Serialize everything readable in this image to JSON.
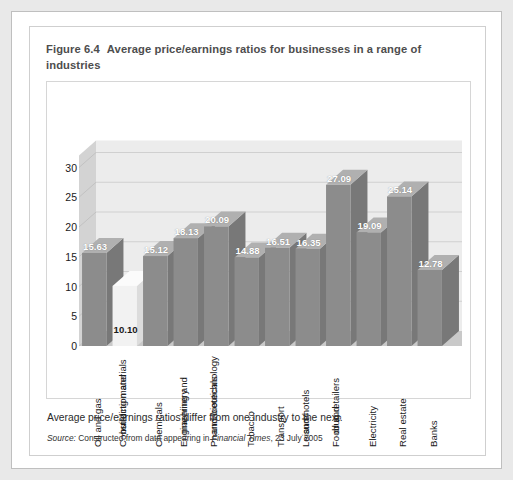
{
  "figure": {
    "number": "Figure 6.4",
    "title": "Average price/earnings ratios for businesses in a range of industries",
    "caption": "Average price/earnings ratios differ from one industry to the next.",
    "source_prefix": "Source:",
    "source_text_1": "Constructed from data appearing in",
    "source_publication": "Financial Times",
    "source_text_2": ", 23 July 2005"
  },
  "chart_data": {
    "type": "bar",
    "title": "Average price/earnings ratios for businesses in a range of industries",
    "xlabel": "",
    "ylabel": "",
    "ylim": [
      0,
      32
    ],
    "yticks": [
      0,
      5,
      10,
      15,
      20,
      25,
      30
    ],
    "grid": true,
    "legend": false,
    "three_d": true,
    "categories": [
      "Oil and gas",
      "Construction and building materials",
      "Chemicals",
      "Engineering and machinery",
      "Pharmaceuticals and biotechnology",
      "Tobacco",
      "Transport",
      "Leisure and hotels",
      "Food and drug retailers",
      "Electricity",
      "Real estate",
      "Banks"
    ],
    "category_lines": [
      [
        "Oil and gas"
      ],
      [
        "Construction and",
        "building materials"
      ],
      [
        "Chemicals"
      ],
      [
        "Engineering and",
        "machinery"
      ],
      [
        "Pharmaceuticals",
        "and biotechnology"
      ],
      [
        "Tobacco"
      ],
      [
        "Transport"
      ],
      [
        "Leisure",
        "and hotels"
      ],
      [
        "Food and",
        "drug retailers"
      ],
      [
        "Electricity"
      ],
      [
        "Real estate"
      ],
      [
        "Banks"
      ]
    ],
    "values": [
      15.63,
      10.1,
      15.12,
      18.13,
      20.09,
      14.88,
      16.51,
      16.35,
      27.09,
      19.09,
      25.14,
      12.78
    ],
    "value_labels": [
      "15.63",
      "10.10",
      "15.12",
      "18.13",
      "20.09",
      "14.88",
      "16.51",
      "16.35",
      "27.09",
      "19.09",
      "25.14",
      "12.78"
    ],
    "bar_colors": [
      "#8c8c8c",
      "#f2f2f2",
      "#8c8c8c",
      "#8c8c8c",
      "#8c8c8c",
      "#8c8c8c",
      "#8c8c8c",
      "#8c8c8c",
      "#8c8c8c",
      "#8c8c8c",
      "#8c8c8c",
      "#8c8c8c"
    ]
  },
  "colors": {
    "bar_front": "#8c8c8c",
    "bar_top": "#b0b0b0",
    "bar_side": "#787878",
    "bar_highlight_front": "#f2f2f2",
    "bar_highlight_top": "#fbfbfb",
    "bar_highlight_side": "#dcdcdc",
    "back_wall": "#ececec",
    "left_wall": "#d3d3d3",
    "floor": "#c9c9c9",
    "gridline": "#d0d0d0",
    "title_text": "#4d4d4d",
    "page_bg": "#e9e9e9"
  }
}
